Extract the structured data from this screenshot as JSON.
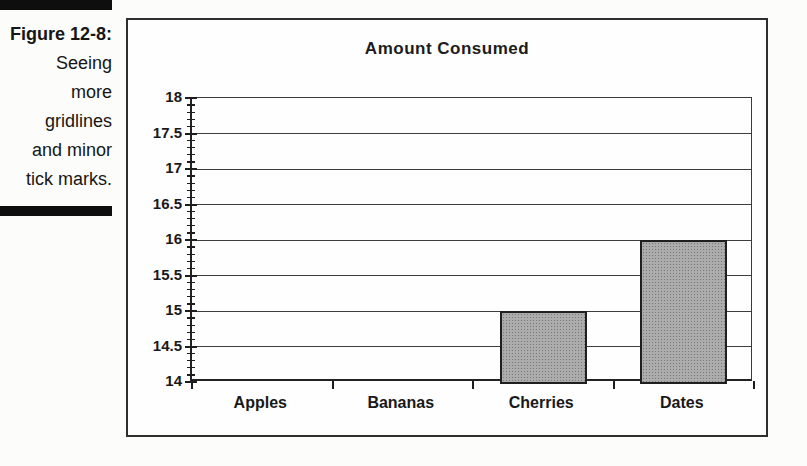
{
  "figure": {
    "caption_title": "Figure 12-8:",
    "caption_lines": [
      "Seeing",
      "more",
      "gridlines",
      "and minor",
      "tick marks."
    ]
  },
  "chart_data": {
    "type": "bar",
    "title": "Amount Consumed",
    "categories": [
      "Apples",
      "Bananas",
      "Cherries",
      "Dates"
    ],
    "values": [
      null,
      null,
      15,
      16
    ],
    "xlabel": "",
    "ylabel": "",
    "ylim": [
      14,
      18
    ],
    "y_major_unit": 0.5,
    "y_minor_unit": 0.1,
    "y_tick_labels": [
      "18",
      "17.5",
      "17",
      "16.5",
      "16",
      "15.5",
      "15",
      "14.5",
      "14"
    ],
    "grid": true,
    "legend": "none",
    "colors": {
      "ink": "#1d1d1d",
      "gridline": "#3d3d3d",
      "bar_fill": "#acacac",
      "bar_dot": "#787878",
      "bar_border": "#1f1f1f",
      "chart_bg": "#fefefe",
      "page_bg": "#fcfcfa",
      "caption_rule": "#0e0e0e"
    }
  }
}
